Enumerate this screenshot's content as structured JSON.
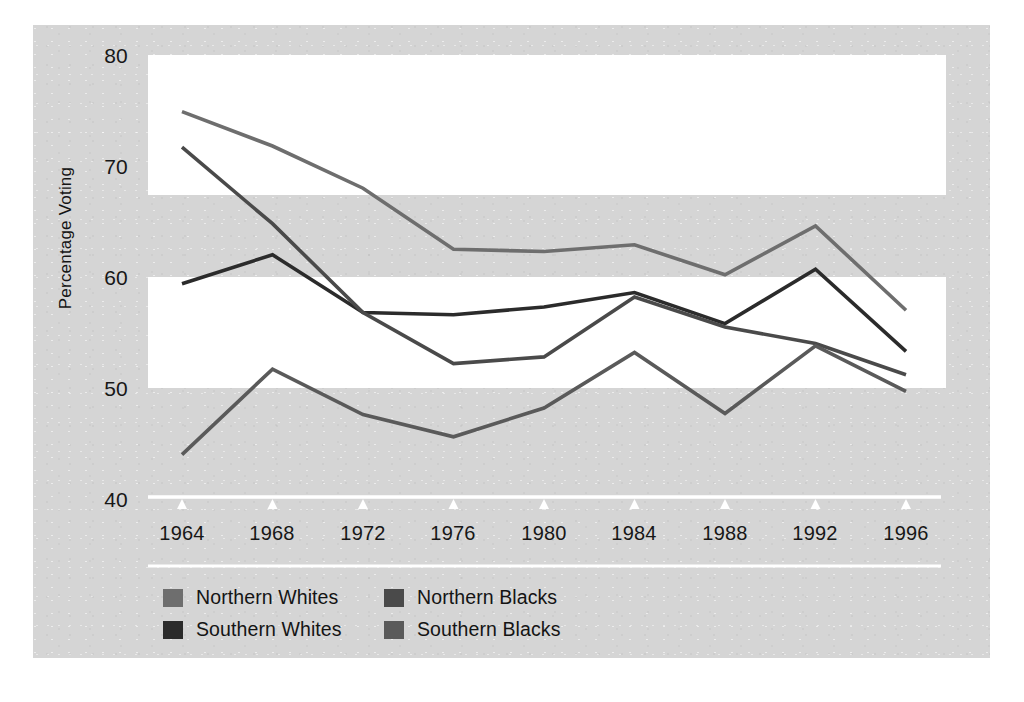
{
  "chart_data": {
    "type": "line",
    "title": "",
    "xlabel": "",
    "ylabel": "Percentage Voting",
    "x": [
      1964,
      1968,
      1972,
      1976,
      1980,
      1984,
      1988,
      1992,
      1996
    ],
    "xtick_labels": [
      "1964",
      "1968",
      "1972",
      "1976",
      "1980",
      "1984",
      "1988",
      "1992",
      "1996"
    ],
    "ytick_labels": [
      "40",
      "50",
      "60",
      "70",
      "80"
    ],
    "yticks": [
      40,
      50,
      60,
      70,
      80
    ],
    "ylim": [
      40,
      80
    ],
    "grid": "horizontal-bands",
    "legend_position": "bottom-left",
    "series": [
      {
        "name": "Northern Whites",
        "color": "#6e6e6e",
        "values": [
          74.9,
          71.8,
          68.0,
          62.5,
          62.3,
          62.9,
          60.2,
          64.6,
          57.0
        ]
      },
      {
        "name": "Southern Whites",
        "color": "#2b2b2b",
        "values": [
          59.4,
          62.0,
          56.8,
          56.6,
          57.3,
          58.6,
          55.8,
          60.7,
          53.3
        ]
      },
      {
        "name": "Northern Blacks",
        "color": "#4a4a4a",
        "values": [
          71.7,
          64.8,
          56.8,
          52.2,
          52.8,
          58.2,
          55.5,
          54.0,
          51.2
        ]
      },
      {
        "name": "Southern Blacks",
        "color": "#5a5a5a",
        "values": [
          44.0,
          51.7,
          47.6,
          45.6,
          48.2,
          53.2,
          47.7,
          53.8,
          49.7
        ]
      }
    ]
  },
  "axis": {
    "y_label": "Percentage Voting",
    "y_ticks": [
      {
        "label": "80",
        "value": 80
      },
      {
        "label": "70",
        "value": 70
      },
      {
        "label": "60",
        "value": 60
      },
      {
        "label": "50",
        "value": 50
      },
      {
        "label": "40",
        "value": 40
      }
    ],
    "x_ticks": [
      {
        "label": "1964"
      },
      {
        "label": "1968"
      },
      {
        "label": "1972"
      },
      {
        "label": "1976"
      },
      {
        "label": "1980"
      },
      {
        "label": "1984"
      },
      {
        "label": "1988"
      },
      {
        "label": "1992"
      },
      {
        "label": "1996"
      }
    ]
  },
  "legend": {
    "items": [
      {
        "label": "Northern Whites",
        "color": "#6e6e6e"
      },
      {
        "label": "Northern Blacks",
        "color": "#4a4a4a"
      },
      {
        "label": "Southern Whites",
        "color": "#2b2b2b"
      },
      {
        "label": "Southern Blacks",
        "color": "#5a5a5a"
      }
    ]
  },
  "colors": {
    "panel_background": "#d5d5d5",
    "band": "#ffffff",
    "axis_line": "#ffffff",
    "text": "#141414"
  }
}
